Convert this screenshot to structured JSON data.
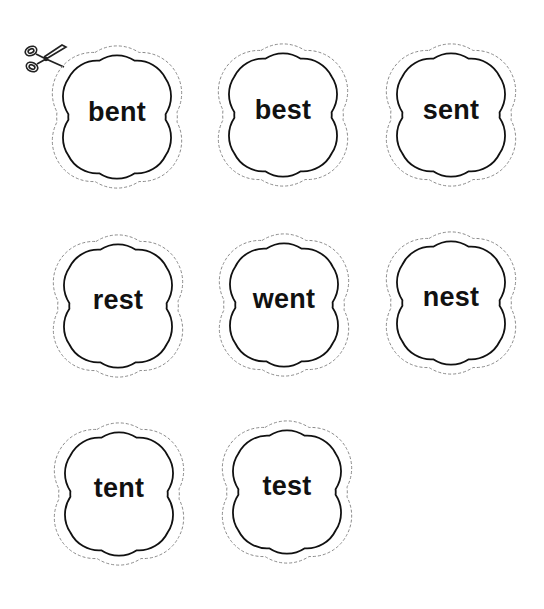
{
  "worksheet": {
    "instruction_icon": "scissors-icon",
    "colors": {
      "outline": "#111111",
      "cut_line": "#8a8a8a",
      "text": "#111111",
      "background": "#ffffff"
    },
    "cards": [
      {
        "word": "bent",
        "cx": 117,
        "cy": 117
      },
      {
        "word": "best",
        "cx": 283,
        "cy": 115
      },
      {
        "word": "sent",
        "cx": 451,
        "cy": 115
      },
      {
        "word": "rest",
        "cx": 118,
        "cy": 306
      },
      {
        "word": "went",
        "cx": 284,
        "cy": 305
      },
      {
        "word": "nest",
        "cx": 451,
        "cy": 303
      },
      {
        "word": "tent",
        "cx": 119,
        "cy": 494
      },
      {
        "word": "test",
        "cx": 287,
        "cy": 492
      }
    ]
  }
}
